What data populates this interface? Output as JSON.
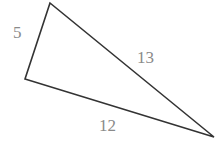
{
  "diagram": {
    "type": "right-triangle",
    "sides": {
      "short_leg": "5",
      "long_leg": "12",
      "hypotenuse": "13"
    },
    "colors": {
      "stroke": "#333333",
      "label": "#8a8a8a",
      "background": "#ffffff"
    }
  }
}
